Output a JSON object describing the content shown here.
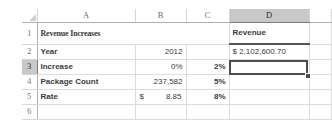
{
  "app": {
    "type": "spreadsheet",
    "select_all_icon": "select-all-triangle",
    "fill_handle_icon": "fill-handle"
  },
  "grid": {
    "column_headers": [
      "A",
      "B",
      "C",
      "D"
    ],
    "row_headers": [
      "1",
      "2",
      "3",
      "4",
      "5",
      "6"
    ],
    "selected_column": "D",
    "selected_row": "3",
    "active_cell": "D3"
  },
  "cells": {
    "A1": "Revenue Increases",
    "D1": "Revenue",
    "A2": "Year",
    "B2": "2012",
    "C2": "",
    "D2": "$ 2,102,600.70",
    "A3": "Increase",
    "B3": "0%",
    "C3": "2%",
    "D3": "",
    "A4": "Package Count",
    "B4": "237,582",
    "C4": "5%",
    "D4": "",
    "A5": "Rate",
    "B5_symbol": "$",
    "B5_amount": "8.85",
    "C5": "8%",
    "D5": "",
    "A6": "",
    "B6": "",
    "C6": "",
    "D6": ""
  },
  "colors": {
    "header_selected_bg": "#c8c8c8",
    "gridline": "#dcdcdc",
    "active_border": "#4d4d4d",
    "text": "#3b3b3b"
  }
}
